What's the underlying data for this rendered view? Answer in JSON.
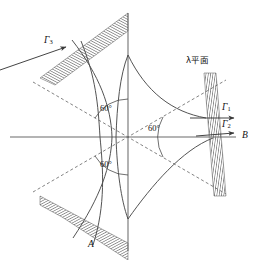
{
  "figure": {
    "background_color": "#ffffff",
    "line_color": "#4a4a4a",
    "axis_color": "#6b6b6b",
    "hatch_color": "#555555",
    "text_color": "#111111",
    "width": 259,
    "height": 260
  },
  "labels": {
    "gamma1": "Γ",
    "gamma1_sub": "1",
    "gamma2": "Γ",
    "gamma2_sub": "2",
    "gamma3": "Γ",
    "gamma3_sub": "3",
    "point_a": "A",
    "point_b": "B",
    "lambda_plane": "λ平面",
    "angle_upper_left": "60°",
    "angle_lower_left": "60°",
    "angle_right": "60°"
  },
  "geometry": {
    "origin_x": 128,
    "origin_y": 137,
    "horizontal_axis": {
      "x1": 10,
      "y1": 137,
      "x2": 236,
      "y2": 137
    },
    "vertical_axis": {
      "x1": 128,
      "y1": 13,
      "x2": 128,
      "y2": 251
    },
    "asymptote_angle_deg": 30,
    "sector_angle_deg": 60,
    "asymptote_upper_left": {
      "x1": 33,
      "y1": 82,
      "x2": 223,
      "y2": 192
    },
    "asymptote_lower_left": {
      "x1": 33,
      "y1": 192,
      "x2": 223,
      "y2": 82
    },
    "hatch_band_upper_left": "strip from dashed asymptote up-right to vertical axis",
    "hatch_band_lower_left": "strip from dashed asymptote down-right to vertical axis",
    "hatch_band_right": "near-vertical strip tilted, crossing the horizontal axis"
  }
}
